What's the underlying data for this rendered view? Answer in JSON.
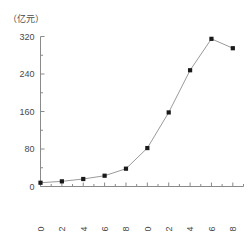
{
  "chart_data": {
    "type": "line",
    "title": "",
    "subtitle": "",
    "xlabel": "",
    "ylabel": "",
    "unit_label": "（亿元）",
    "x": [
      2000,
      2002,
      2004,
      2006,
      2008,
      2010,
      2012,
      2014,
      2016,
      2018
    ],
    "categories": [
      "2000",
      "2002",
      "2004",
      "2006",
      "2008",
      "2010",
      "2012",
      "2014",
      "2016",
      "2018"
    ],
    "values": [
      8,
      11,
      16,
      23,
      38,
      82,
      158,
      248,
      315,
      295
    ],
    "series": [
      {
        "name": "",
        "values": [
          8,
          11,
          16,
          23,
          38,
          82,
          158,
          248,
          315,
          295
        ]
      }
    ],
    "ylim": [
      0,
      320
    ],
    "yticks": [
      0,
      80,
      160,
      240,
      320
    ],
    "ytick_labels": [
      "0",
      "80",
      "160",
      "240",
      "320"
    ],
    "xlim": [
      2000,
      2019
    ],
    "xticks": [
      2000,
      2002,
      2004,
      2006,
      2008,
      2010,
      2012,
      2014,
      2016,
      2018
    ],
    "xtick_labels": [
      "2000",
      "2002",
      "2004",
      "2006",
      "2008",
      "2010",
      "2012",
      "2014",
      "2016",
      "2018"
    ],
    "xtick_rotation": 90,
    "minor_xticks": [
      2001,
      2003,
      2005,
      2007,
      2009,
      2011,
      2013,
      2015,
      2017,
      2019
    ],
    "grid": false,
    "legend": false,
    "legend_position": "none",
    "marker": "square",
    "marker_color": "#1a1a1a",
    "line_color": "#9a9a9a",
    "axis_color": "#8a8a8a",
    "text_color": "#4a4a4a",
    "background": "#ffffff"
  }
}
